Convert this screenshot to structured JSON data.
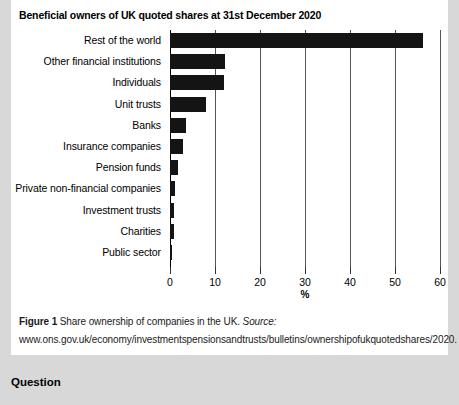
{
  "chart_data": {
    "type": "bar",
    "orientation": "horizontal",
    "title": "Beneficial owners of UK quoted shares at 31st December 2020",
    "xlabel": "%",
    "ylabel": "",
    "xlim": [
      0,
      60
    ],
    "xticks": [
      0,
      10,
      20,
      30,
      40,
      50,
      60
    ],
    "xtick_labels": [
      "0",
      "10",
      "20",
      "30",
      "40",
      "50",
      "60"
    ],
    "grid": true,
    "legend": "none",
    "categories": [
      "Rest of the world",
      "Other financial institutions",
      "Individuals",
      "Unit trusts",
      "Banks",
      "Insurance companies",
      "Pension funds",
      "Private non-financial companies",
      "Investment trusts",
      "Charities",
      "Public sector"
    ],
    "values": [
      56.3,
      12.3,
      12.0,
      8.0,
      3.5,
      2.8,
      1.8,
      1.1,
      0.9,
      0.8,
      0.5
    ],
    "bar_color": "#141414"
  },
  "caption": {
    "figure_label": "Figure 1",
    "text": " Share ownership of companies in the UK. ",
    "source_label": "Source:",
    "source_url": " www.ons.gov.uk/economy/investmentspensionsandtrusts/bulletins/ownershipofukquotedshares/2020."
  },
  "question": {
    "heading": "Question"
  }
}
